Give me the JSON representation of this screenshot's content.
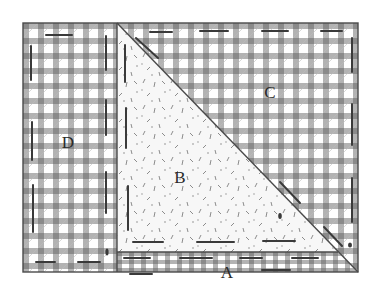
{
  "diagram": {
    "colors": {
      "gingham_band": "#a6a6a6",
      "gingham_cross": "#8a8a8a",
      "gingham_white": "#ffffff",
      "outline": "#4a4a4a",
      "stitch": "#3a3a3a",
      "triangle_fill": "#f7f7f7",
      "speckle": "#8c8c8c"
    },
    "pieces": [
      {
        "id": "A",
        "label": "A",
        "shape": "bottom strip under triangle",
        "x": 227,
        "y": 272
      },
      {
        "id": "B",
        "label": "B",
        "shape": "speckled right triangle",
        "x": 180,
        "y": 177
      },
      {
        "id": "C",
        "label": "C",
        "shape": "gingham upper-right triangle",
        "x": 270,
        "y": 92
      },
      {
        "id": "D",
        "label": "D",
        "shape": "gingham left rectangle",
        "x": 68,
        "y": 142
      }
    ]
  }
}
